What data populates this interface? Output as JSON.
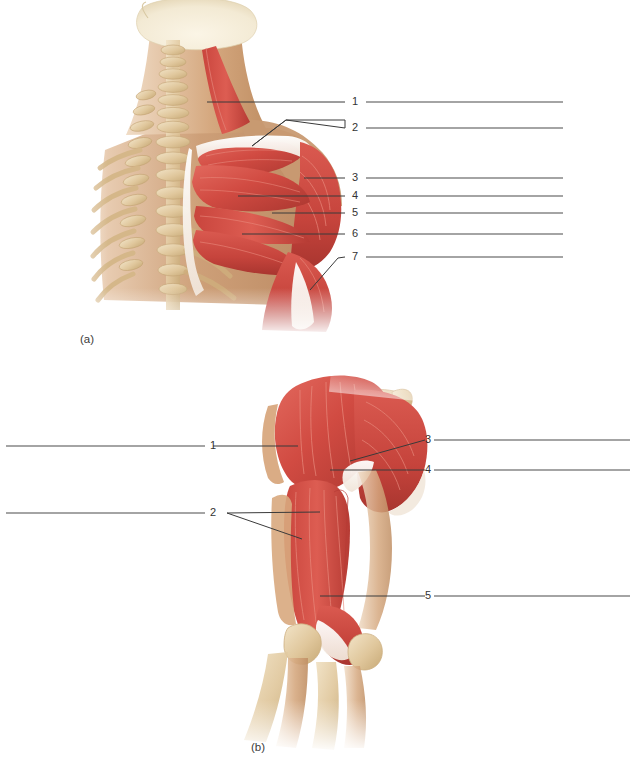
{
  "figure": {
    "title_visible": false,
    "panels": [
      {
        "id": "panel-a",
        "caption": "(a)",
        "view": "posterior-superficial-shoulder-and-neck",
        "labels": [
          {
            "number": "1",
            "y": 102
          },
          {
            "number": "2",
            "y": 128
          },
          {
            "number": "3",
            "y": 178
          },
          {
            "number": "4",
            "y": 196
          },
          {
            "number": "5",
            "y": 213
          },
          {
            "number": "6",
            "y": 234
          },
          {
            "number": "7",
            "y": 257
          }
        ]
      },
      {
        "id": "panel-b",
        "caption": "(b)",
        "view": "posterior-arm-deltoid-triceps",
        "labels_left": [
          {
            "number": "1",
            "y": 446
          },
          {
            "number": "2",
            "y": 513
          }
        ],
        "labels_right": [
          {
            "number": "3",
            "y": 440
          },
          {
            "number": "4",
            "y": 470
          },
          {
            "number": "5",
            "y": 596
          }
        ]
      }
    ],
    "colors": {
      "muscle": "#cf4a41",
      "muscle_dark": "#b03a33",
      "muscle_light": "#e0776c",
      "tendon": "#f4ece2",
      "bone": "#e2c89c",
      "bone_shadow": "#c9a974",
      "skin": "#c9976e",
      "skin_light": "#ddb592",
      "line": "#3a3a3a",
      "background": "#ffffff"
    }
  }
}
